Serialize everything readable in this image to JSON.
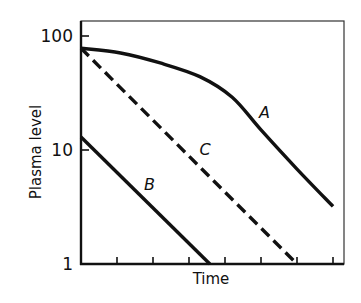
{
  "chart_data": {
    "type": "line",
    "title": "",
    "xlabel": "Time",
    "ylabel": "Plasma level",
    "yscale": "log",
    "ylim": [
      1,
      125
    ],
    "xlim": [
      0,
      7.3
    ],
    "y_ticks": [
      {
        "value": 1,
        "label": "1"
      },
      {
        "value": 10,
        "label": "10"
      },
      {
        "value": 100,
        "label": "100"
      }
    ],
    "x_ticks": [
      1,
      2,
      3,
      4,
      5,
      6,
      7
    ],
    "x_tick_labels_shown": false,
    "grid": false,
    "legend": "none (curves labeled inline)",
    "series": [
      {
        "name": "A",
        "style": "solid",
        "label": "A",
        "label_pos": {
          "x": 5.1,
          "y": 21.5
        },
        "points": [
          [
            0,
            78
          ],
          [
            1.1,
            71
          ],
          [
            2.2,
            58
          ],
          [
            3.3,
            44
          ],
          [
            4.2,
            29
          ],
          [
            5.0,
            15
          ],
          [
            6.0,
            6.8
          ],
          [
            7.0,
            3.2
          ]
        ]
      },
      {
        "name": "B",
        "style": "solid",
        "label": "B",
        "label_pos": {
          "x": 1.9,
          "y": 5.0
        },
        "points": [
          [
            0,
            13
          ],
          [
            3.58,
            1
          ]
        ]
      },
      {
        "name": "C",
        "style": "dashed",
        "label": "C",
        "label_pos": {
          "x": 3.45,
          "y": 10.2
        },
        "points": [
          [
            0,
            78
          ],
          [
            6.0,
            1
          ]
        ]
      }
    ]
  }
}
